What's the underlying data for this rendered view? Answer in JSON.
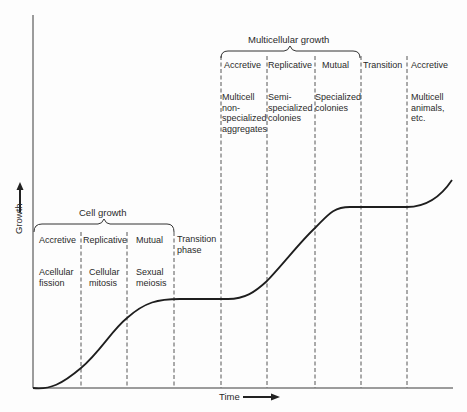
{
  "diagram": {
    "x_axis_label": "Time",
    "y_axis_label": "Growth",
    "groups": [
      {
        "title": "Cell growth"
      },
      {
        "title": "Multicellular growth"
      }
    ],
    "phases": [
      {
        "header": "Accretive",
        "desc_lines": [
          "Acellular",
          "fission"
        ]
      },
      {
        "header": "Replicative",
        "desc_lines": [
          "Cellular",
          "mitosis"
        ]
      },
      {
        "header": "Mutual",
        "desc_lines": [
          "Sexual",
          "meiosis"
        ]
      },
      {
        "header_lines": [
          "Transition",
          "phase"
        ]
      },
      {
        "header": "Accretive",
        "desc_lines": [
          "Multicell",
          "non-",
          "specialized",
          "aggregates"
        ]
      },
      {
        "header": "Replicative",
        "desc_lines": [
          "Semi-",
          "specialized",
          "colonies"
        ]
      },
      {
        "header": "Mutual",
        "desc_lines": [
          "Specialized",
          "colonies"
        ]
      },
      {
        "header": "Transition"
      },
      {
        "header": "Accretive",
        "desc_lines": [
          "Multicell",
          "animals,",
          "etc."
        ]
      }
    ],
    "colors": {
      "ink": "#2a2a2a",
      "background": "#fdfdfd"
    }
  }
}
